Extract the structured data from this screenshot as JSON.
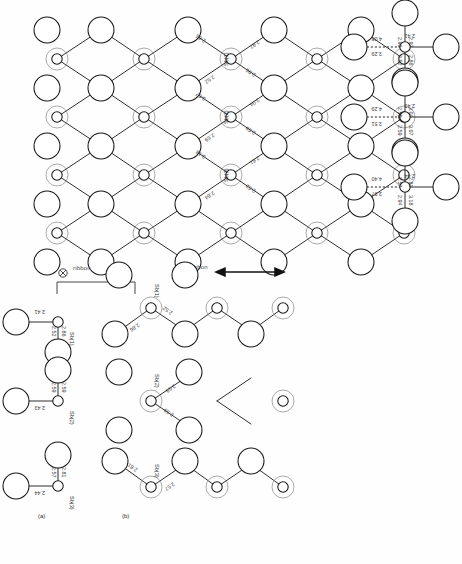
{
  "figure": {
    "kind": "crystal-structure-diagram",
    "orientation_note": "rotated-180",
    "panel_labels": {
      "a": "(a)",
      "b": "(b)"
    },
    "ribbon_label_left": "ribbon",
    "ribbon_label_right": "ribbon",
    "perpendicular_symbol": "⊗"
  },
  "colors": {
    "stroke": "#171717",
    "halo": "#8d8d8d",
    "text": "#3a3a3a",
    "background": "#ffffff"
  },
  "atoms": {
    "sb1": "Sb(1)",
    "sb2": "Sb(2)",
    "sb3": "Sb(3)"
  },
  "lattice_panel": {
    "name": "upper-left-lattice",
    "sites": [
      {
        "label": "Sb(1)",
        "distances": [
          "2.86",
          "2.52",
          "2.96",
          "2.97"
        ]
      },
      {
        "label": "Sb(2)",
        "distances": [
          "3.07",
          "2.59",
          "2.59",
          "3.04"
        ]
      },
      {
        "label": "Sb(3)",
        "distances": [
          "3.18",
          "2.84",
          "2.52",
          "2.61"
        ]
      }
    ]
  },
  "chain_panel": {
    "name": "upper-right-chains",
    "chains": [
      {
        "label": "Sb(1)",
        "up_left": "2.86",
        "up_right": "2.52",
        "left": "2.41",
        "right_long": "3.29",
        "right_short": "4.08",
        "down_left": "2.97",
        "down_right": "2.96"
      },
      {
        "label": "Sb(2)",
        "up_left": "3.07",
        "up_right": "2.59",
        "left": "2.43",
        "right_long": "3.51",
        "right_short": "4.29",
        "down_left": "3.04",
        "down_right": "2.59"
      },
      {
        "label": "Sb(3)",
        "up_left": "3.18",
        "up_right": "2.94",
        "left": "2.44",
        "right_long": "3.97",
        "right_short": "4.40",
        "down_left": "2.81",
        "down_right": "2.57"
      }
    ]
  },
  "panel_a": {
    "title": "(a)",
    "units": [
      {
        "label": "Sb(1)",
        "d1": "2.86",
        "d2": "2.52",
        "d3": "2.41"
      },
      {
        "label": "Sb(2)",
        "d1": "2.43",
        "d2": "2.59",
        "d3": "2.59"
      },
      {
        "label": "Sb(3)",
        "d1": "2.44",
        "d2": "2.81",
        "d3": "2.57"
      }
    ]
  },
  "panel_b": {
    "title": "(b)",
    "chains": [
      {
        "label": "Sb(1)",
        "d1": "2.86",
        "d2": "2.52"
      },
      {
        "label": "Sb(2)",
        "d1": "2.59",
        "d2": "2.59"
      },
      {
        "label": "Sb(3)",
        "d1": "2.81",
        "d2": "2.57"
      }
    ]
  }
}
